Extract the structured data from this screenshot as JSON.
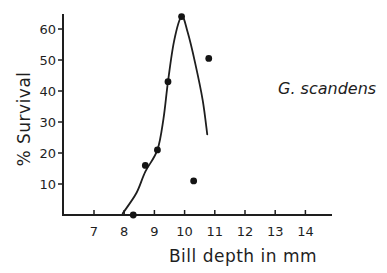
{
  "chart_data": {
    "type": "scatter",
    "title": "",
    "annotation": "G. scandens",
    "xlabel": "Bill depth in mm",
    "ylabel": "% Survival",
    "xlim": [
      6.0,
      14.8
    ],
    "ylim": [
      0,
      65
    ],
    "xticks": [
      7,
      8,
      9,
      10,
      11,
      12,
      13,
      14
    ],
    "yticks": [
      10,
      20,
      30,
      40,
      50,
      60
    ],
    "grid": false,
    "legend": null,
    "series": [
      {
        "name": "observed",
        "kind": "points",
        "x": [
          8.3,
          8.7,
          9.1,
          9.45,
          9.9,
          10.3,
          10.8
        ],
        "y": [
          0,
          16,
          21,
          43,
          64,
          11,
          50.5
        ]
      },
      {
        "name": "fitted curve",
        "kind": "line",
        "x": [
          7.95,
          8.4,
          8.7,
          9.1,
          9.3,
          9.45,
          9.65,
          9.9,
          10.1,
          10.35,
          10.6,
          10.75
        ],
        "y": [
          0.5,
          7,
          14,
          21,
          31,
          43,
          56,
          64,
          59,
          49,
          37,
          26
        ]
      }
    ]
  },
  "labels": {
    "xlabel": "Bill depth in mm",
    "ylabel": "% Survival",
    "species": "G. scandens"
  }
}
